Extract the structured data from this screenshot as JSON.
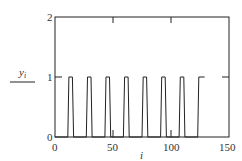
{
  "chart_data": {
    "type": "line",
    "title": "",
    "xlabel": "i",
    "ylabel": "y_i",
    "xlim": [
      0,
      150
    ],
    "ylim": [
      0,
      2
    ],
    "xticks": [
      "0",
      "50",
      "100",
      "150"
    ],
    "yticks": [
      "0",
      "1",
      "2"
    ],
    "grid": false,
    "legend": null,
    "series": [
      {
        "name": "y_i",
        "x": [
          0,
          11,
          12,
          15,
          16,
          27,
          28,
          31,
          32,
          43,
          44,
          47,
          48,
          59,
          60,
          63,
          64,
          75,
          76,
          79,
          80,
          91,
          92,
          95,
          96,
          107,
          108,
          111,
          112,
          123,
          124,
          129
        ],
        "y": [
          0,
          0,
          1,
          1,
          0,
          0,
          1,
          1,
          0,
          0,
          1,
          1,
          0,
          0,
          1,
          1,
          0,
          0,
          1,
          1,
          0,
          0,
          1,
          1,
          0,
          0,
          1,
          1,
          0,
          0,
          1,
          1
        ]
      }
    ]
  },
  "labels": {
    "x_axis": "i",
    "y_axis_main": "y",
    "y_axis_sub": "i",
    "x_tick_0": "0",
    "x_tick_50": "50",
    "x_tick_100": "100",
    "x_tick_150": "150",
    "y_tick_0": "0",
    "y_tick_1": "1",
    "y_tick_2": "2"
  },
  "colors": {
    "line": "#222222",
    "axis": "#222222"
  }
}
